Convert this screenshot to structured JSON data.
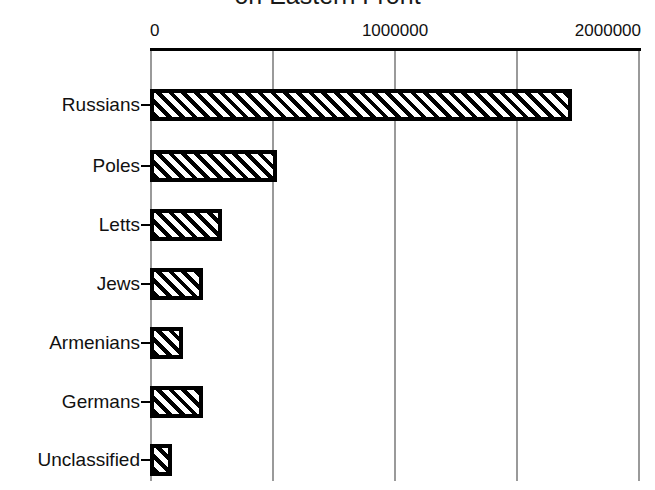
{
  "chart_data": {
    "type": "bar",
    "orientation": "horizontal",
    "title": "on Eastern Front",
    "xlabel": "",
    "ylabel": "",
    "categories": [
      "Russians",
      "Poles",
      "Letts",
      "Jews",
      "Armenians",
      "Germans",
      "Unclassified"
    ],
    "values": [
      1722000,
      518000,
      294000,
      216000,
      135000,
      216000,
      90000
    ],
    "xlim": [
      0,
      2000000
    ],
    "xticks": [
      0,
      500000,
      1000000,
      1500000,
      2000000
    ],
    "xtick_labels": [
      "0",
      "",
      "1000000",
      "",
      "2000000"
    ],
    "grid": true,
    "legend": false,
    "axis_position": "top",
    "bar_fill": "diagonal-hatch",
    "colors": {
      "bar_border": "#000000",
      "bar_hatch": "#000000",
      "bar_background": "#ffffff",
      "gridline": "#9a9a9a",
      "axis": "#000000",
      "text": "#111111",
      "plot_background": "#ffffff"
    }
  }
}
